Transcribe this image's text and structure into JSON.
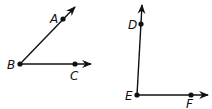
{
  "figure": {
    "angles": [
      {
        "name": "angle-ABC",
        "vertex": {
          "label": "B",
          "x": 20,
          "y": 64
        },
        "ray1": {
          "point": {
            "label": "A",
            "x": 63,
            "y": 19
          },
          "tip": {
            "x": 75,
            "y": 7
          }
        },
        "ray2": {
          "point": {
            "label": "C",
            "x": 75,
            "y": 64
          },
          "tip": {
            "x": 91,
            "y": 64
          }
        }
      },
      {
        "name": "angle-DEF",
        "vertex": {
          "label": "E",
          "x": 137,
          "y": 95
        },
        "ray1": {
          "point": {
            "label": "D",
            "x": 141,
            "y": 24
          },
          "tip": {
            "x": 142,
            "y": 5
          }
        },
        "ray2": {
          "point": {
            "label": "F",
            "x": 191,
            "y": 95
          },
          "tip": {
            "x": 208,
            "y": 95
          }
        }
      }
    ],
    "labels": {
      "A": "A",
      "B": "B",
      "C": "C",
      "D": "D",
      "E": "E",
      "F": "F"
    },
    "colors": {
      "stroke": "#111111",
      "background": "#ffffff"
    }
  }
}
